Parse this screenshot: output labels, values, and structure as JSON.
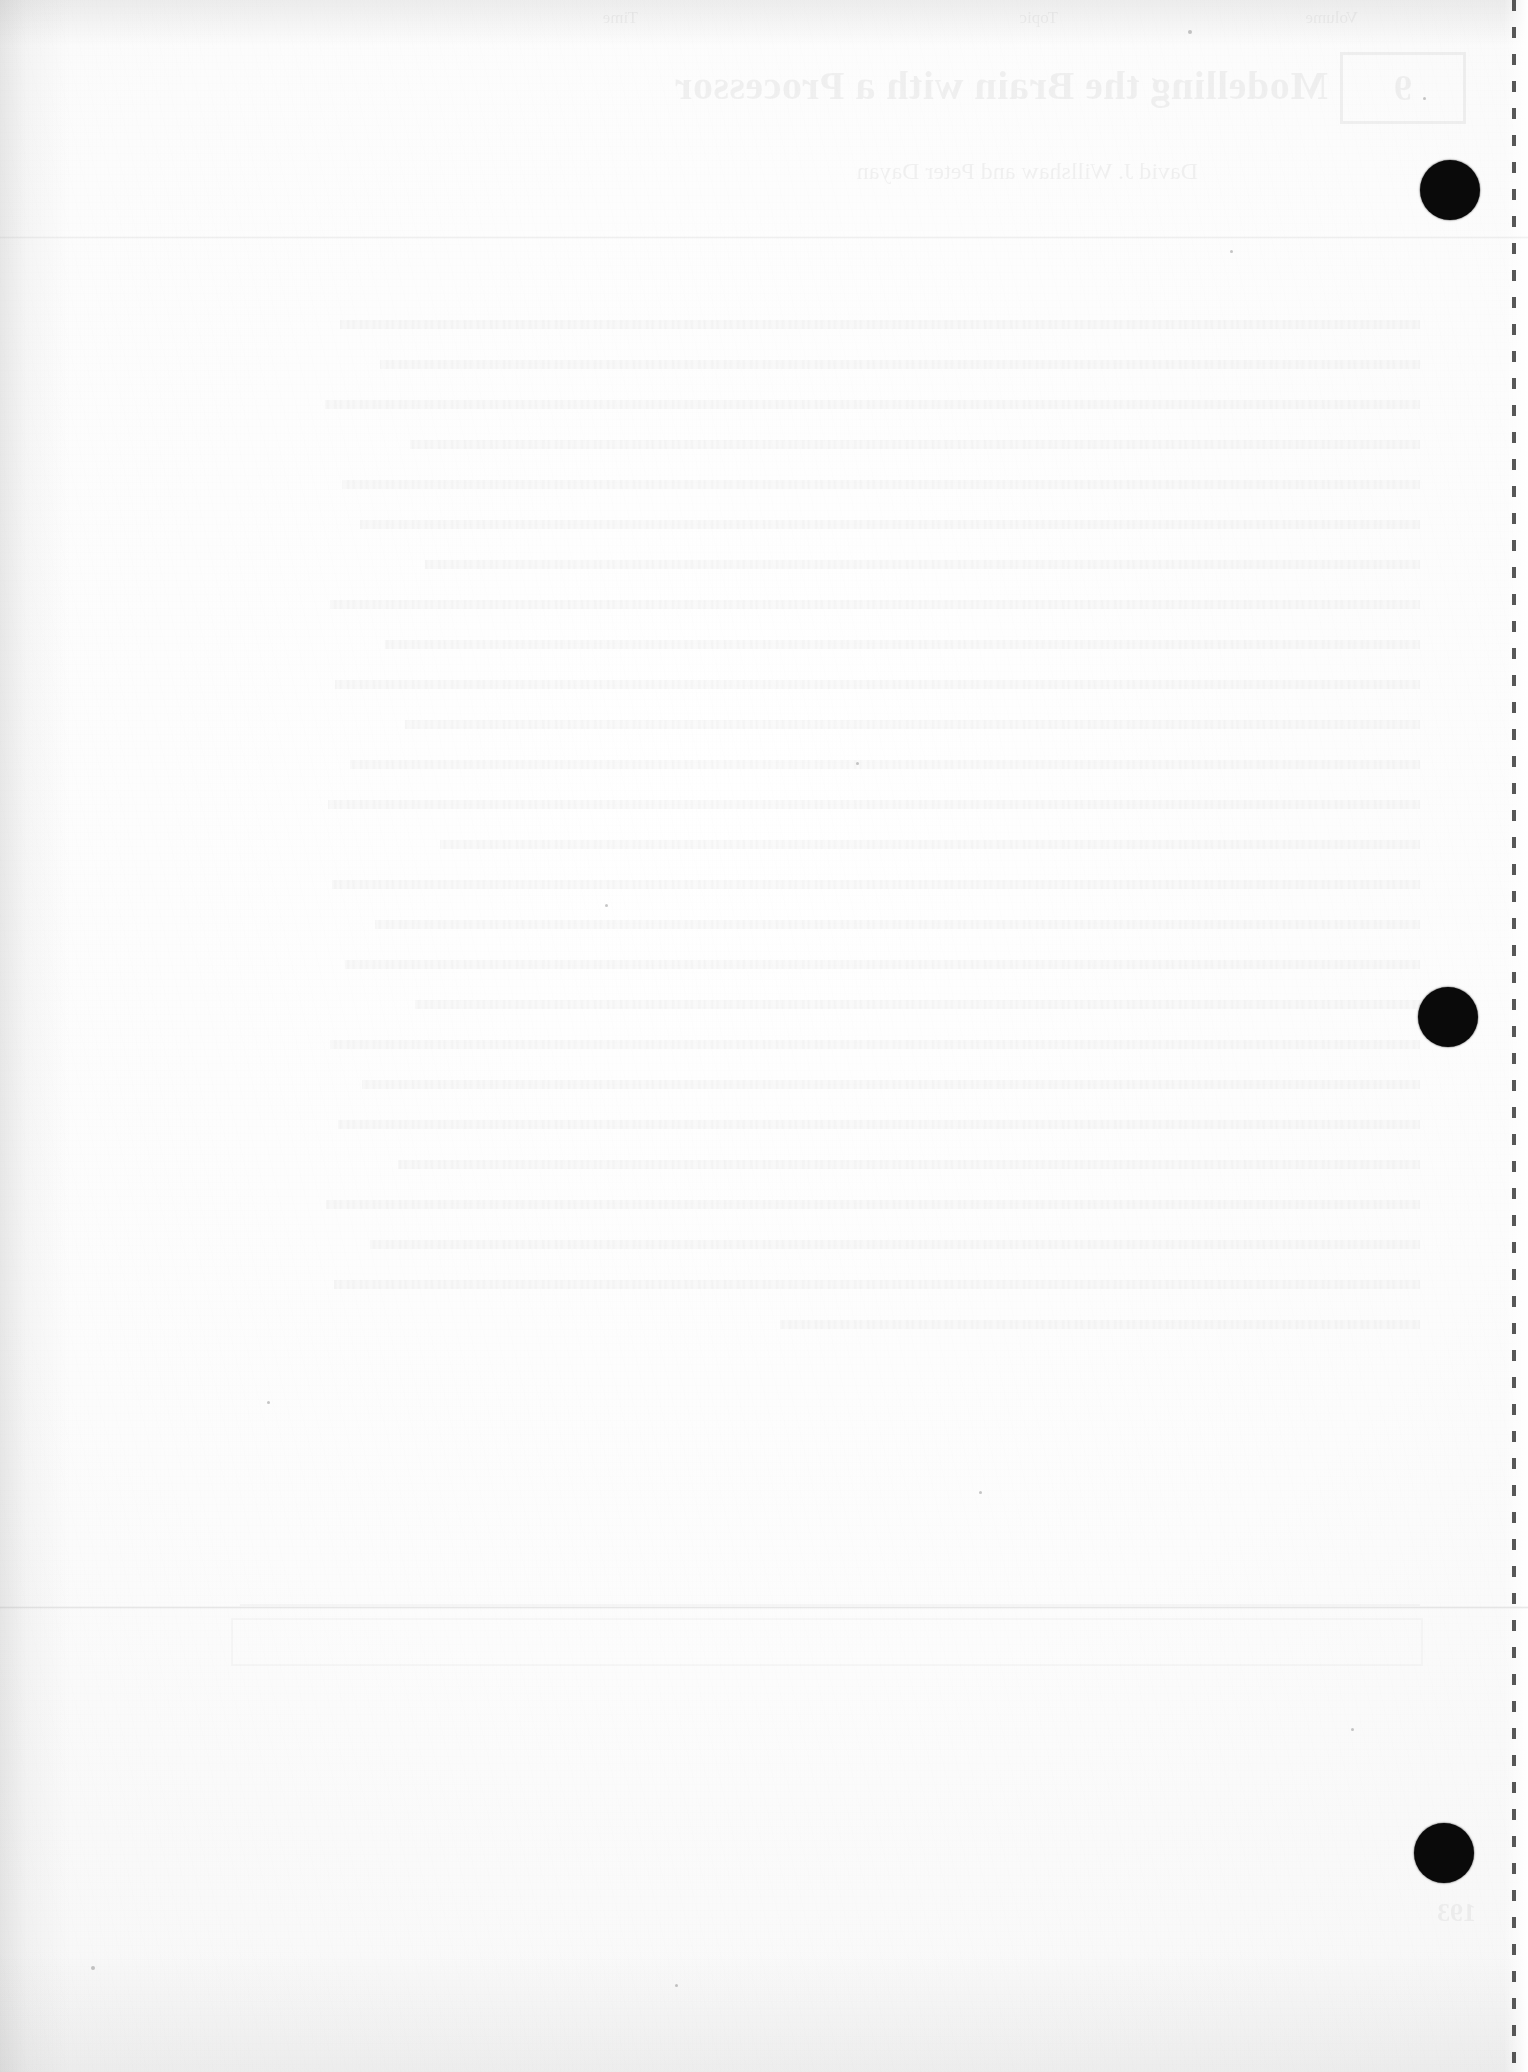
{
  "document": {
    "type": "scanned-page",
    "page_kind": "blank verso (back of printed leaf)",
    "paper_color": "#fdfdfd",
    "ink_color": "#0a0a0a",
    "width_px": 1528,
    "height_px": 2072
  },
  "show_through": {
    "note": "Mirror-reversed bleed-through from the printed recto side; extremely faint.",
    "chapter_number": "9",
    "title": "Modelling the Brain with a Processor",
    "subtitle": "David J. Willshaw and Peter Dayan",
    "running_head_left": "Volume",
    "running_head_center": "Topic",
    "running_head_right": "Time",
    "page_number": "193",
    "body_block_lines": 26,
    "has_table_box": true,
    "has_horizontal_rule": true
  },
  "marks": {
    "registration_dots": [
      {
        "label": "registration-dot-top",
        "cx": 1450,
        "cy": 190,
        "r": 30
      },
      {
        "label": "registration-dot-middle",
        "cx": 1448,
        "cy": 1017,
        "r": 30
      },
      {
        "label": "registration-dot-bottom",
        "cx": 1444,
        "cy": 1853,
        "r": 30
      }
    ],
    "perforation_line": {
      "label": "perforation-dashed-line",
      "x": 1512,
      "dash_length": 11,
      "gap_length": 16
    },
    "crease_lines": [
      {
        "label": "horizontal-crease",
        "y": 1606
      },
      {
        "label": "horizontal-crease-faint",
        "y": 236
      }
    ],
    "specks": [
      {
        "cx": 1190,
        "cy": 32,
        "r": 2.0
      },
      {
        "cx": 1232,
        "cy": 252,
        "r": 1.6
      },
      {
        "cx": 1424,
        "cy": 98,
        "r": 1.4
      },
      {
        "cx": 606,
        "cy": 905,
        "r": 1.5
      },
      {
        "cx": 857,
        "cy": 763,
        "r": 1.3
      },
      {
        "cx": 268,
        "cy": 1402,
        "r": 1.5
      },
      {
        "cx": 980,
        "cy": 1492,
        "r": 1.3
      },
      {
        "cx": 1352,
        "cy": 1729,
        "r": 1.4
      },
      {
        "cx": 92,
        "cy": 1968,
        "r": 1.8
      },
      {
        "cx": 676,
        "cy": 1985,
        "r": 1.2
      }
    ]
  }
}
